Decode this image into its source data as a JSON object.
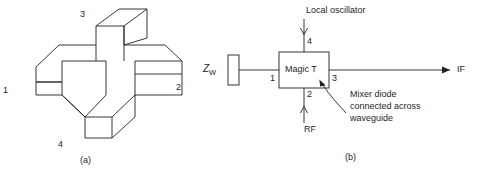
{
  "figure": {
    "panels": [
      {
        "id": "a",
        "caption": "(a)",
        "description": "isometric-waveguide-magic-tee",
        "port_labels": [
          "1",
          "2",
          "3",
          "4"
        ]
      },
      {
        "id": "b",
        "caption": "(b)",
        "description": "block-diagram-magic-tee-mixer"
      }
    ],
    "panel_a": {
      "caption": "(a)",
      "port_1": "1",
      "port_2": "2",
      "port_3": "3",
      "port_4": "4"
    },
    "panel_b": {
      "caption": "(b)",
      "termination_label_main": "Z",
      "termination_label_sub": "W",
      "block_label": "Magic T",
      "port_1": "1",
      "port_2": "2",
      "port_3": "3",
      "port_4": "4",
      "top_signal": "Local oscillator",
      "bottom_signal": "RF",
      "right_signal": "IF",
      "annotation_lines": [
        "Mixer diode",
        "connected across",
        "waveguide"
      ]
    },
    "colors": {
      "stroke": "#231f20",
      "text": "#231f20",
      "background": "#ffffff"
    }
  }
}
